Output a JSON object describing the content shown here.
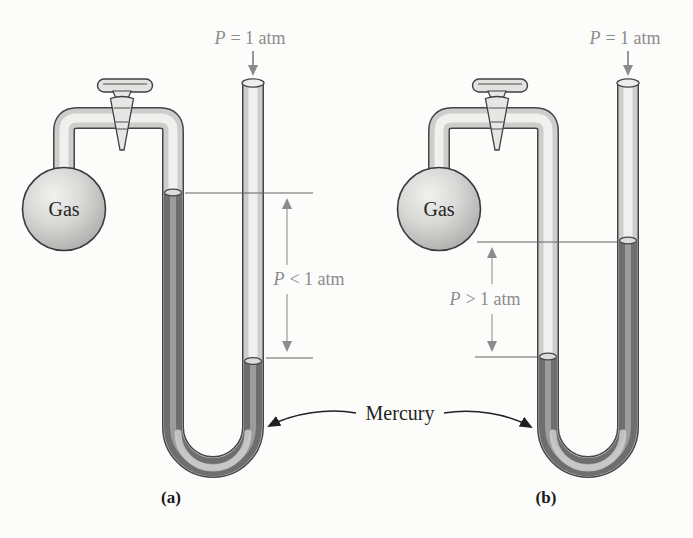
{
  "figure": {
    "mercury_label": "Mercury",
    "panel_a": {
      "caption": "(a)",
      "gas_label": "Gas",
      "atm_pressure": {
        "symbol": "P",
        "value": "= 1 atm"
      },
      "gas_pressure": {
        "symbol": "P",
        "value": "< 1 atm"
      }
    },
    "panel_b": {
      "caption": "(b)",
      "gas_label": "Gas",
      "atm_pressure": {
        "symbol": "P",
        "value": "= 1 atm"
      },
      "gas_pressure": {
        "symbol": "P",
        "value": "> 1 atm"
      }
    },
    "colors": {
      "background": "#fcfcfa",
      "label_gray": "#8c8c8c",
      "ink": "#1f1f1f",
      "glass_tube": "#cdcdcb",
      "glass_highlight": "#f0f0ee",
      "mercury": "#6e6e6e",
      "mercury_highlight": "#a8a8a8",
      "tube_outline": "#454545"
    }
  }
}
